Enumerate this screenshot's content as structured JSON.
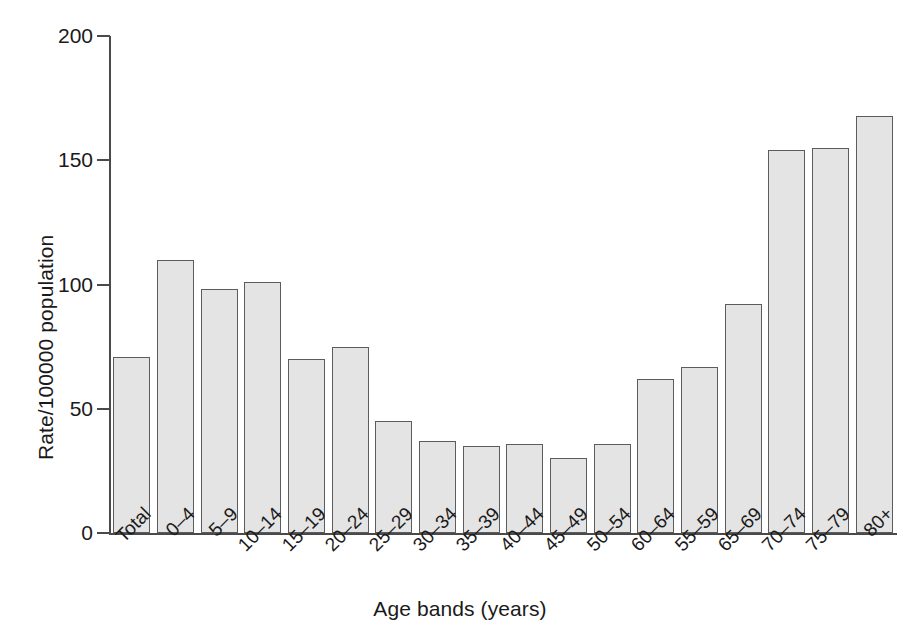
{
  "chart_data": {
    "type": "bar",
    "title": "",
    "xlabel": "Age bands (years)",
    "ylabel": "Rate/100000 population",
    "categories": [
      "Total",
      "0–4",
      "5–9",
      "10–14",
      "15–19",
      "20–24",
      "25–29",
      "30–34",
      "35–39",
      "40–44",
      "45–49",
      "50–54",
      "60–64",
      "55–59",
      "65–69",
      "70–74",
      "75–79",
      "80+"
    ],
    "values": [
      71,
      110,
      98,
      101,
      70,
      75,
      45,
      37,
      35,
      36,
      30,
      36,
      62,
      67,
      92,
      154,
      155,
      168
    ],
    "ylim": [
      0,
      200
    ],
    "yticks": [
      0,
      50,
      100,
      150,
      200
    ],
    "ytick_labels": [
      "0",
      "50",
      "100",
      "150",
      "200"
    ],
    "grid": false,
    "legend": null,
    "bar_fill_color": "#e4e4e4",
    "bar_edge_color": "#5c5c5c",
    "axis_color": "#4a4a4a"
  }
}
